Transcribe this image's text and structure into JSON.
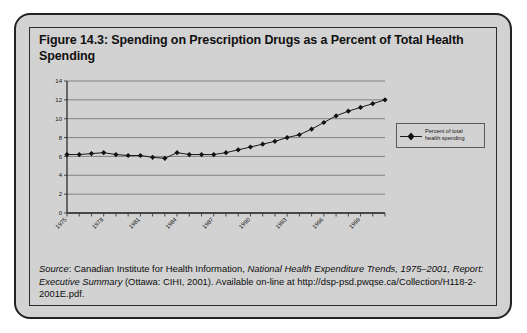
{
  "figure": {
    "title": "Figure 14.3: Spending on Prescription Drugs as a Percent of Total Health Spending",
    "source_prefix": "Source",
    "source_colon": ": Canadian Institute for Health Information, ",
    "source_italic_1": "National Health Expenditure Trends, 1975–2001, Report: Executive Summary",
    "source_rest": " (Ottawa: CIHI, 2001). Available on-line at http://dsp-psd.pwqse.ca/Collection/H118-2-2001E.pdf."
  },
  "chart_data": {
    "type": "line",
    "title": "",
    "xlabel": "",
    "ylabel": "",
    "ylim": [
      0,
      14
    ],
    "yticks": [
      0,
      2,
      4,
      6,
      8,
      10,
      12,
      14
    ],
    "grid": true,
    "legend_position": "right",
    "marker": "diamond",
    "line_color": "#1a1a1a",
    "marker_color": "#111111",
    "categories": [
      "1975",
      "1976",
      "1977",
      "1978",
      "1979",
      "1980",
      "1981",
      "1982",
      "1983",
      "1984",
      "1985",
      "1986",
      "1987",
      "1988",
      "1989",
      "1990",
      "1991",
      "1992",
      "1993",
      "1994",
      "1995",
      "1996",
      "1997",
      "1998",
      "1999",
      "2000",
      "2001"
    ],
    "xtick_labels": [
      "1975",
      "1978",
      "1981",
      "1984",
      "1987",
      "1990",
      "1993",
      "1996",
      "1999"
    ],
    "series": [
      {
        "name": "Percent of total health spending",
        "values": [
          6.2,
          6.2,
          6.3,
          6.4,
          6.2,
          6.1,
          6.1,
          5.9,
          5.8,
          6.4,
          6.2,
          6.2,
          6.2,
          6.4,
          6.7,
          7.0,
          7.3,
          7.6,
          8.0,
          8.3,
          8.9,
          9.6,
          10.3,
          10.8,
          11.2,
          11.6,
          12.0
        ]
      }
    ],
    "legend_entries": [
      {
        "label_line1": "Percent of total",
        "label_line2": "health spending"
      }
    ]
  }
}
